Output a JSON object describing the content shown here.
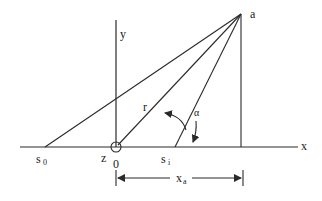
{
  "diagram": {
    "type": "geometry",
    "labels": {
      "apex": "a",
      "y_axis": "y",
      "x_axis": "x",
      "s0": "s",
      "s0_sub": "0",
      "si": "s",
      "si_sub": "i",
      "z": "z",
      "origin": "0",
      "r": "r",
      "alpha": "α",
      "xa": "x",
      "xa_sub": "a"
    },
    "colors": {
      "line": "#2a2a2a",
      "background": "#ffffff"
    },
    "points": {
      "apex": [
        241,
        14
      ],
      "origin": [
        116,
        147
      ],
      "s0": [
        45,
        147
      ],
      "si": [
        175,
        147
      ],
      "foot": [
        241,
        147
      ]
    }
  }
}
